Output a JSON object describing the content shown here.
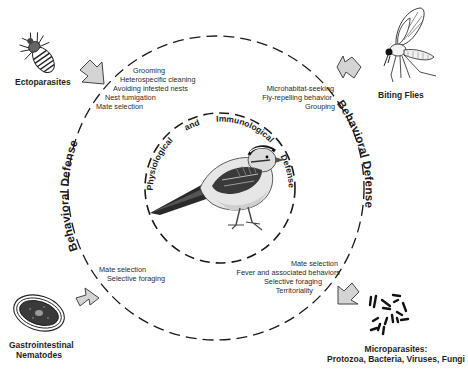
{
  "diagram": {
    "outer_ring_label": "Behavioral Defense",
    "inner_ring_label_words": [
      "Physiological",
      "and",
      "Immunological",
      "Defense"
    ],
    "center_subject": "bird-icon"
  },
  "parasites": {
    "ectoparasites": {
      "label": "Ectoparasites",
      "icon": "louse-icon"
    },
    "biting_flies": {
      "label": "Biting Flies",
      "icon": "fly-icon"
    },
    "nematodes": {
      "label_line1": "Gastrointestinal",
      "label_line2": "Nematodes",
      "icon": "nematode-egg-icon"
    },
    "microparasites": {
      "label_line1": "Microparasites:",
      "label_line2": "Protozoa, Bacteria, Viruses, Fungi",
      "icon": "microbes-icon"
    }
  },
  "behaviors": {
    "ectoparasites": [
      "Grooming",
      "Heterospecific cleaning",
      "Avoiding infested nests",
      "Nest fumigation",
      "Mate selection"
    ],
    "biting_flies": [
      "Microhabitat-seeking",
      "Fly-repelling behavior",
      "Grouping"
    ],
    "nematodes": [
      "Mate selection",
      "Selective foraging"
    ],
    "microparasites": [
      "Mate selection",
      "Fever and associated behaviors",
      "Selective foraging",
      "Territoriality"
    ]
  },
  "colors": {
    "arrow_fill": "#d4d4d4",
    "arrow_stroke": "#444444",
    "ring_stroke": "#1a1a1a",
    "text": "#222222"
  }
}
